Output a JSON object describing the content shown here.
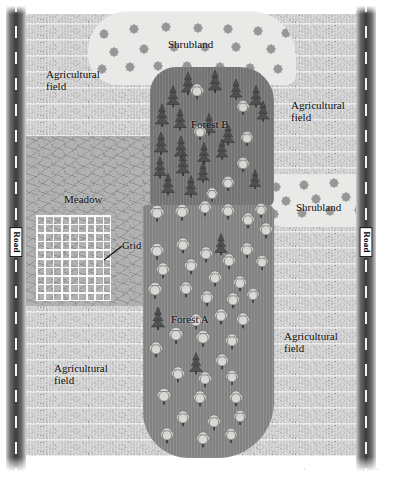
{
  "map": {
    "title": "Landscape habitat map",
    "width": 398,
    "height": 483,
    "background_color": "#ffffff"
  },
  "roads": [
    {
      "id": "road-left",
      "label": "Road",
      "x": 14,
      "orientation": "vertical",
      "surface_color": "#3a3a3a",
      "dash_color": "#f2f2f2"
    },
    {
      "id": "road-right",
      "label": "Road",
      "x": 364,
      "orientation": "vertical",
      "surface_color": "#3a3a3a",
      "dash_color": "#f2f2f2"
    }
  ],
  "habitats": [
    {
      "id": "agricultural-field-nw",
      "label": "Agricultural\nfield",
      "type": "agricultural-field",
      "fill_color": "#8f8f8f",
      "label_x": 46,
      "label_y": 68
    },
    {
      "id": "agricultural-field-ne",
      "label": "Agricultural\nfield",
      "type": "agricultural-field",
      "fill_color": "#8f8f8f",
      "label_x": 291,
      "label_y": 99
    },
    {
      "id": "agricultural-field-sw",
      "label": "Agricultural\nfield",
      "type": "agricultural-field",
      "fill_color": "#8f8f8f",
      "label_x": 54,
      "label_y": 362
    },
    {
      "id": "agricultural-field-se",
      "label": "Agricultural\nfield",
      "type": "agricultural-field",
      "fill_color": "#8f8f8f",
      "label_x": 284,
      "label_y": 330
    },
    {
      "id": "shrubland-north",
      "label": "Shrubland",
      "type": "shrubland",
      "fill_color": "#e9e9e7",
      "dot_color": "#8e8e8e",
      "label_x": 168,
      "label_y": 38
    },
    {
      "id": "shrubland-east",
      "label": "Shrubland",
      "type": "shrubland",
      "fill_color": "#e9e9e7",
      "dot_color": "#8e8e8e",
      "label_x": 296,
      "label_y": 201
    },
    {
      "id": "meadow",
      "label": "Meadow",
      "type": "meadow",
      "fill_color": "#b2b2b2",
      "label_x": 64,
      "label_y": 193
    },
    {
      "id": "forest-b",
      "label": "Forest B",
      "type": "forest",
      "dominant_trees": "conifer",
      "fill_color": "#7a7a7a",
      "label_x": 191,
      "label_y": 118
    },
    {
      "id": "forest-a",
      "label": "Forest A",
      "type": "forest",
      "dominant_trees": "deciduous",
      "fill_color": "#8a8a8a",
      "label_x": 171,
      "label_y": 313
    }
  ],
  "annotations": [
    {
      "id": "grid",
      "label": "Grid",
      "label_x": 122,
      "label_y": 240,
      "leader_from_x": 104,
      "leader_from_y": 259,
      "leader_to_x": 121,
      "leader_to_y": 247,
      "grid": {
        "x": 36,
        "y": 215,
        "width": 75,
        "height": 86,
        "columns": 9,
        "rows": 10,
        "line_color": "#ffffff"
      }
    }
  ],
  "scale_bar": {
    "id": "scale-bar",
    "label": "",
    "x": 304,
    "y": 468,
    "width": 72
  },
  "tree_symbols": {
    "conifer_color": "#4f4f4f",
    "deciduous_color": "#d9d9d5",
    "trunk_color": "#3a3a3a"
  },
  "trees_forest_b": [
    {
      "x": 188,
      "y": 82,
      "t": "c",
      "s": 1.0
    },
    {
      "x": 215,
      "y": 80,
      "t": "c",
      "s": 1.0
    },
    {
      "x": 236,
      "y": 88,
      "t": "c",
      "s": 0.9
    },
    {
      "x": 256,
      "y": 95,
      "t": "c",
      "s": 0.95
    },
    {
      "x": 173,
      "y": 95,
      "t": "c",
      "s": 0.95
    },
    {
      "x": 197,
      "y": 93,
      "t": "d",
      "s": 0.9
    },
    {
      "x": 243,
      "y": 109,
      "t": "d",
      "s": 0.85
    },
    {
      "x": 263,
      "y": 110,
      "t": "c",
      "s": 0.9
    },
    {
      "x": 162,
      "y": 114,
      "t": "c",
      "s": 1.0
    },
    {
      "x": 180,
      "y": 118,
      "t": "c",
      "s": 0.95
    },
    {
      "x": 209,
      "y": 123,
      "t": "c",
      "s": 0.95
    },
    {
      "x": 200,
      "y": 134,
      "t": "d",
      "s": 0.85
    },
    {
      "x": 228,
      "y": 133,
      "t": "c",
      "s": 0.95
    },
    {
      "x": 247,
      "y": 140,
      "t": "d",
      "s": 0.85
    },
    {
      "x": 161,
      "y": 142,
      "t": "c",
      "s": 1.0
    },
    {
      "x": 181,
      "y": 146,
      "t": "c",
      "s": 1.0
    },
    {
      "x": 204,
      "y": 152,
      "t": "c",
      "s": 0.95
    },
    {
      "x": 222,
      "y": 148,
      "t": "c",
      "s": 0.9
    },
    {
      "x": 243,
      "y": 166,
      "t": "d",
      "s": 0.85
    },
    {
      "x": 160,
      "y": 166,
      "t": "c",
      "s": 0.95
    },
    {
      "x": 183,
      "y": 163,
      "t": "c",
      "s": 1.0
    },
    {
      "x": 203,
      "y": 171,
      "t": "c",
      "s": 0.9
    },
    {
      "x": 168,
      "y": 183,
      "t": "c",
      "s": 0.95
    },
    {
      "x": 191,
      "y": 185,
      "t": "c",
      "s": 0.95
    },
    {
      "x": 228,
      "y": 185,
      "t": "d",
      "s": 0.85
    },
    {
      "x": 212,
      "y": 196,
      "t": "d",
      "s": 0.8
    },
    {
      "x": 255,
      "y": 178,
      "t": "c",
      "s": 0.85
    }
  ],
  "trees_forest_a": [
    {
      "x": 157,
      "y": 215,
      "t": "d",
      "s": 0.95
    },
    {
      "x": 182,
      "y": 214,
      "t": "d",
      "s": 0.95
    },
    {
      "x": 205,
      "y": 210,
      "t": "d",
      "s": 0.9
    },
    {
      "x": 228,
      "y": 213,
      "t": "d",
      "s": 0.9
    },
    {
      "x": 248,
      "y": 222,
      "t": "d",
      "s": 0.9
    },
    {
      "x": 261,
      "y": 212,
      "t": "d",
      "s": 0.85
    },
    {
      "x": 266,
      "y": 232,
      "t": "d",
      "s": 0.9
    },
    {
      "x": 221,
      "y": 243,
      "t": "c",
      "s": 0.95
    },
    {
      "x": 247,
      "y": 252,
      "t": "d",
      "s": 0.9
    },
    {
      "x": 157,
      "y": 253,
      "t": "d",
      "s": 0.95
    },
    {
      "x": 183,
      "y": 247,
      "t": "d",
      "s": 0.9
    },
    {
      "x": 206,
      "y": 256,
      "t": "d",
      "s": 0.9
    },
    {
      "x": 229,
      "y": 263,
      "t": "d",
      "s": 0.9
    },
    {
      "x": 262,
      "y": 264,
      "t": "d",
      "s": 0.85
    },
    {
      "x": 163,
      "y": 272,
      "t": "d",
      "s": 0.9
    },
    {
      "x": 191,
      "y": 268,
      "t": "d",
      "s": 0.9
    },
    {
      "x": 215,
      "y": 280,
      "t": "d",
      "s": 0.9
    },
    {
      "x": 240,
      "y": 285,
      "t": "d",
      "s": 0.9
    },
    {
      "x": 155,
      "y": 292,
      "t": "d",
      "s": 0.95
    },
    {
      "x": 186,
      "y": 291,
      "t": "d",
      "s": 0.9
    },
    {
      "x": 207,
      "y": 300,
      "t": "d",
      "s": 0.9
    },
    {
      "x": 233,
      "y": 302,
      "t": "d",
      "s": 0.9
    },
    {
      "x": 253,
      "y": 297,
      "t": "d",
      "s": 0.85
    },
    {
      "x": 158,
      "y": 317,
      "t": "c",
      "s": 1.0
    },
    {
      "x": 196,
      "y": 323,
      "t": "d",
      "s": 0.9
    },
    {
      "x": 221,
      "y": 318,
      "t": "d",
      "s": 0.9
    },
    {
      "x": 243,
      "y": 322,
      "t": "d",
      "s": 0.9
    },
    {
      "x": 176,
      "y": 337,
      "t": "d",
      "s": 0.95
    },
    {
      "x": 203,
      "y": 340,
      "t": "d",
      "s": 0.95
    },
    {
      "x": 232,
      "y": 343,
      "t": "d",
      "s": 0.9
    },
    {
      "x": 156,
      "y": 351,
      "t": "d",
      "s": 0.9
    },
    {
      "x": 196,
      "y": 362,
      "t": "c",
      "s": 0.95
    },
    {
      "x": 222,
      "y": 363,
      "t": "d",
      "s": 0.9
    },
    {
      "x": 178,
      "y": 376,
      "t": "d",
      "s": 0.9
    },
    {
      "x": 205,
      "y": 381,
      "t": "d",
      "s": 0.9
    },
    {
      "x": 232,
      "y": 379,
      "t": "d",
      "s": 0.85
    },
    {
      "x": 164,
      "y": 398,
      "t": "d",
      "s": 0.95
    },
    {
      "x": 200,
      "y": 400,
      "t": "d",
      "s": 0.9
    },
    {
      "x": 236,
      "y": 400,
      "t": "d",
      "s": 0.9
    },
    {
      "x": 183,
      "y": 420,
      "t": "d",
      "s": 0.9
    },
    {
      "x": 214,
      "y": 424,
      "t": "d",
      "s": 0.9
    },
    {
      "x": 240,
      "y": 419,
      "t": "d",
      "s": 0.85
    },
    {
      "x": 167,
      "y": 437,
      "t": "d",
      "s": 0.9
    },
    {
      "x": 203,
      "y": 441,
      "t": "d",
      "s": 0.9
    },
    {
      "x": 231,
      "y": 437,
      "t": "d",
      "s": 0.85
    }
  ],
  "shrub_dots_north": [
    {
      "x": 16,
      "y": 23
    },
    {
      "x": 46,
      "y": 18
    },
    {
      "x": 78,
      "y": 16
    },
    {
      "x": 110,
      "y": 17
    },
    {
      "x": 140,
      "y": 18
    },
    {
      "x": 170,
      "y": 20
    },
    {
      "x": 198,
      "y": 22
    },
    {
      "x": 228,
      "y": 24
    },
    {
      "x": 26,
      "y": 41
    },
    {
      "x": 56,
      "y": 38
    },
    {
      "x": 86,
      "y": 36
    },
    {
      "x": 117,
      "y": 36
    },
    {
      "x": 148,
      "y": 36
    },
    {
      "x": 183,
      "y": 38
    },
    {
      "x": 212,
      "y": 41
    },
    {
      "x": 239,
      "y": 42
    },
    {
      "x": 14,
      "y": 58
    },
    {
      "x": 42,
      "y": 56
    },
    {
      "x": 70,
      "y": 55
    },
    {
      "x": 99,
      "y": 55
    },
    {
      "x": 132,
      "y": 56
    },
    {
      "x": 162,
      "y": 57
    },
    {
      "x": 190,
      "y": 58
    },
    {
      "x": 221,
      "y": 60
    }
  ],
  "shrub_dots_east": [
    {
      "x": 14,
      "y": 13
    },
    {
      "x": 42,
      "y": 11
    },
    {
      "x": 72,
      "y": 9
    },
    {
      "x": 101,
      "y": 8
    },
    {
      "x": 24,
      "y": 27
    },
    {
      "x": 54,
      "y": 25
    },
    {
      "x": 84,
      "y": 23
    },
    {
      "x": 113,
      "y": 22
    },
    {
      "x": 12,
      "y": 40
    },
    {
      "x": 40,
      "y": 39
    },
    {
      "x": 68,
      "y": 37
    },
    {
      "x": 97,
      "y": 36
    }
  ]
}
